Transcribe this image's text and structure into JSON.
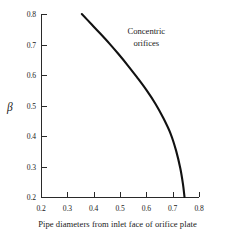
{
  "chart_data": {
    "type": "line",
    "title": "",
    "xlabel": "Pipe diameters from inlet face of orifice plate",
    "ylabel": "β",
    "xlim": [
      0.2,
      0.8
    ],
    "ylim": [
      0.2,
      0.8
    ],
    "xticks": [
      "0.2",
      "0.3",
      "0.4",
      "0.5",
      "0.6",
      "0.7",
      "0.8"
    ],
    "xtick_values": [
      0.2,
      0.3,
      0.4,
      0.5,
      0.6,
      0.7,
      0.8
    ],
    "yticks": [
      "0.2",
      "0.3",
      "0.4",
      "0.5",
      "0.6",
      "0.7",
      "0.8"
    ],
    "ytick_values": [
      0.2,
      0.3,
      0.4,
      0.5,
      0.6,
      0.7,
      0.8
    ],
    "grid": false,
    "legend": false,
    "annotations": [
      {
        "text_line1": "Concentric",
        "text_line2": "orifices",
        "x": 0.6,
        "y": 0.74
      }
    ],
    "series": [
      {
        "name": "Concentric orifices",
        "color": "#111111",
        "line_width": 2.1,
        "x": [
          0.355,
          0.39,
          0.425,
          0.46,
          0.495,
          0.53,
          0.565,
          0.6,
          0.635,
          0.665,
          0.692,
          0.713,
          0.729,
          0.739,
          0.745
        ],
        "y": [
          0.8,
          0.768,
          0.736,
          0.703,
          0.668,
          0.631,
          0.592,
          0.551,
          0.505,
          0.458,
          0.408,
          0.352,
          0.294,
          0.243,
          0.2
        ]
      }
    ]
  },
  "figure": {
    "background_color": "#ffffff",
    "axis_color": "#2a2a2a"
  }
}
